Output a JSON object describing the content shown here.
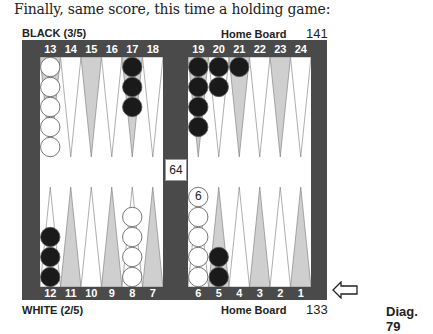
{
  "caption": "Finally, same score, this time a holding game:",
  "top": {
    "player": "BLACK (3/5)",
    "home_label": "Home Board",
    "pip_count": "141",
    "numbers_left": [
      "13",
      "14",
      "15",
      "16",
      "17",
      "18"
    ],
    "numbers_right": [
      "19",
      "20",
      "21",
      "22",
      "23",
      "24"
    ]
  },
  "bottom": {
    "player": "WHITE (2/5)",
    "home_label": "Home Board",
    "pip_count": "133",
    "numbers_left": [
      "12",
      "11",
      "10",
      "9",
      "8",
      "7"
    ],
    "numbers_right": [
      "6",
      "5",
      "4",
      "3",
      "2",
      "1"
    ]
  },
  "cube": {
    "value": "64"
  },
  "diagram_label": "Diag. 79",
  "turn_indicator": "arrow-left-white",
  "colors": {
    "frame": "#4a4a4a",
    "shaded_point": "#cfcfcf",
    "black_checker": "#1a1a1a",
    "white_checker": "#ffffff"
  },
  "positions": [
    {
      "point": 13,
      "color": "white",
      "count": 5
    },
    {
      "point": 17,
      "color": "black",
      "count": 3
    },
    {
      "point": 19,
      "color": "black",
      "count": 4
    },
    {
      "point": 20,
      "color": "black",
      "count": 2
    },
    {
      "point": 21,
      "color": "black",
      "count": 1
    },
    {
      "point": 12,
      "color": "black",
      "count": 3
    },
    {
      "point": 8,
      "color": "white",
      "count": 4
    },
    {
      "point": 6,
      "color": "white",
      "count": 6,
      "label": "6"
    },
    {
      "point": 5,
      "color": "black",
      "count": 2
    }
  ]
}
